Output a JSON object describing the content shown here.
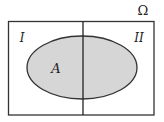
{
  "diagram": {
    "universe_label": "Ω",
    "regions": [
      {
        "id": "I",
        "label": "I"
      },
      {
        "id": "II",
        "label": "II"
      }
    ],
    "set_label": "A",
    "colors": {
      "stroke": "#333333",
      "set_fill": "#d6d6d6",
      "background": "#ffffff"
    }
  }
}
